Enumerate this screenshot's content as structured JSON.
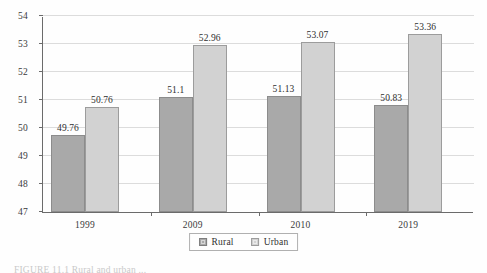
{
  "chart_data": {
    "type": "bar",
    "title": "",
    "xlabel": "",
    "ylabel": "",
    "categories": [
      "1999",
      "2009",
      "2010",
      "2019"
    ],
    "series": [
      {
        "name": "Rural",
        "color": "#a9a9a9",
        "values": [
          49.76,
          51.1,
          51.13,
          50.83
        ],
        "labels": [
          "49.76",
          "51.1",
          "51.13",
          "50.83"
        ]
      },
      {
        "name": "Urban",
        "color": "#d2d2d2",
        "values": [
          50.76,
          52.96,
          53.07,
          53.36
        ],
        "labels": [
          "50.76",
          "52.96",
          "53.07",
          "53.36"
        ]
      }
    ],
    "ylim": [
      47,
      54
    ],
    "yticks": [
      47,
      48,
      49,
      50,
      51,
      52,
      53,
      54
    ],
    "ytick_labels": [
      "47",
      "48",
      "49",
      "50",
      "51",
      "52",
      "53",
      "54"
    ],
    "grid": true,
    "legend_position": "bottom-center"
  },
  "legend": {
    "entries": [
      {
        "label": "Rural"
      },
      {
        "label": "Urban"
      }
    ]
  },
  "caption": {
    "text": "FIGURE 11.1  Rural and urban ..."
  }
}
